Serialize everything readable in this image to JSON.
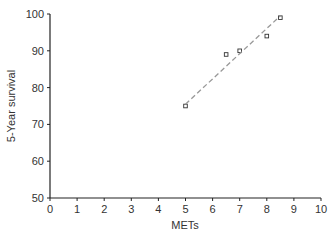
{
  "chart_data": {
    "type": "scatter",
    "title": "",
    "xlabel": "METs",
    "ylabel": "5-Year survival",
    "xlim": [
      0,
      10
    ],
    "ylim": [
      50,
      100
    ],
    "xticks": [
      0,
      1,
      2,
      3,
      4,
      5,
      6,
      7,
      8,
      9,
      10
    ],
    "yticks": [
      50,
      60,
      70,
      80,
      90,
      100
    ],
    "grid": false,
    "legend": null,
    "series": [
      {
        "name": "observed",
        "marker": "open-square",
        "points": [
          {
            "x": 5.0,
            "y": 75
          },
          {
            "x": 6.5,
            "y": 89
          },
          {
            "x": 7.0,
            "y": 90
          },
          {
            "x": 8.0,
            "y": 94
          },
          {
            "x": 8.5,
            "y": 99
          }
        ]
      },
      {
        "name": "trend",
        "style": "dashed",
        "color": "#999999",
        "points": [
          {
            "x": 5.0,
            "y": 75.5
          },
          {
            "x": 8.5,
            "y": 99.5
          }
        ]
      }
    ]
  }
}
